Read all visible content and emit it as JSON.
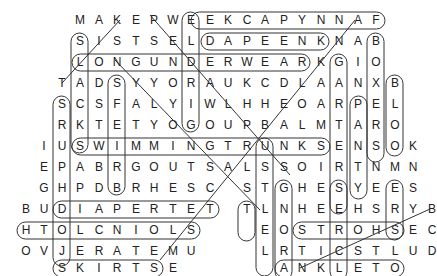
{
  "puzzle": {
    "type": "word-search",
    "rows": [
      {
        "y": 20,
        "cells": [
          [
            80,
            "M"
          ],
          [
            99,
            "A"
          ],
          [
            117,
            "K"
          ],
          [
            136,
            "E"
          ],
          [
            154,
            "P"
          ],
          [
            173,
            "W"
          ],
          [
            191,
            "E"
          ],
          [
            210,
            "E"
          ],
          [
            228,
            "K"
          ],
          [
            247,
            "C"
          ],
          [
            265,
            "A"
          ],
          [
            284,
            "P"
          ],
          [
            302,
            "Y"
          ],
          [
            321,
            "N"
          ],
          [
            339,
            "N"
          ],
          [
            358,
            "A"
          ],
          [
            376,
            "F"
          ]
        ]
      },
      {
        "y": 41,
        "cells": [
          [
            80,
            "S"
          ],
          [
            99,
            "I"
          ],
          [
            117,
            "S"
          ],
          [
            136,
            "T"
          ],
          [
            154,
            "S"
          ],
          [
            173,
            "E"
          ],
          [
            191,
            "L"
          ],
          [
            210,
            "D"
          ],
          [
            228,
            "A"
          ],
          [
            247,
            "P"
          ],
          [
            265,
            "E"
          ],
          [
            284,
            "E"
          ],
          [
            302,
            "N"
          ],
          [
            321,
            "K"
          ],
          [
            339,
            "N"
          ],
          [
            358,
            "A"
          ],
          [
            376,
            "B"
          ]
        ]
      },
      {
        "y": 62,
        "cells": [
          [
            80,
            "L"
          ],
          [
            99,
            "O"
          ],
          [
            117,
            "N"
          ],
          [
            136,
            "G"
          ],
          [
            154,
            "U"
          ],
          [
            173,
            "N"
          ],
          [
            191,
            "D"
          ],
          [
            210,
            "E"
          ],
          [
            228,
            "R"
          ],
          [
            247,
            "W"
          ],
          [
            265,
            "E"
          ],
          [
            284,
            "A"
          ],
          [
            302,
            "R"
          ],
          [
            321,
            "K"
          ],
          [
            339,
            "G"
          ],
          [
            358,
            "I"
          ],
          [
            376,
            "O"
          ]
        ]
      },
      {
        "y": 83,
        "cells": [
          [
            62,
            "T"
          ],
          [
            80,
            "A"
          ],
          [
            99,
            "D"
          ],
          [
            117,
            "S"
          ],
          [
            136,
            "Y"
          ],
          [
            154,
            "Y"
          ],
          [
            173,
            "O"
          ],
          [
            191,
            "R"
          ],
          [
            210,
            "A"
          ],
          [
            228,
            "U"
          ],
          [
            247,
            "K"
          ],
          [
            265,
            "C"
          ],
          [
            284,
            "D"
          ],
          [
            302,
            "L"
          ],
          [
            321,
            "A"
          ],
          [
            339,
            "A"
          ],
          [
            358,
            "N"
          ],
          [
            376,
            "X"
          ],
          [
            395,
            "B"
          ]
        ]
      },
      {
        "y": 104,
        "cells": [
          [
            62,
            "S"
          ],
          [
            80,
            "C"
          ],
          [
            99,
            "S"
          ],
          [
            117,
            "F"
          ],
          [
            136,
            "A"
          ],
          [
            154,
            "L"
          ],
          [
            173,
            "Y"
          ],
          [
            191,
            "I"
          ],
          [
            210,
            "W"
          ],
          [
            228,
            "L"
          ],
          [
            247,
            "H"
          ],
          [
            265,
            "H"
          ],
          [
            284,
            "E"
          ],
          [
            302,
            "O"
          ],
          [
            321,
            "A"
          ],
          [
            339,
            "R"
          ],
          [
            358,
            "P"
          ],
          [
            376,
            "E"
          ],
          [
            395,
            "L"
          ]
        ]
      },
      {
        "y": 125,
        "cells": [
          [
            62,
            "R"
          ],
          [
            80,
            "K"
          ],
          [
            99,
            "T"
          ],
          [
            117,
            "E"
          ],
          [
            136,
            "T"
          ],
          [
            154,
            "Y"
          ],
          [
            173,
            "O"
          ],
          [
            191,
            "G"
          ],
          [
            210,
            "O"
          ],
          [
            228,
            "U"
          ],
          [
            247,
            "P"
          ],
          [
            265,
            "B"
          ],
          [
            284,
            "A"
          ],
          [
            302,
            "L"
          ],
          [
            321,
            "M"
          ],
          [
            339,
            "T"
          ],
          [
            358,
            "A"
          ],
          [
            376,
            "R"
          ],
          [
            395,
            "O"
          ]
        ]
      },
      {
        "y": 146,
        "cells": [
          [
            44,
            "I"
          ],
          [
            62,
            "U"
          ],
          [
            80,
            "S"
          ],
          [
            99,
            "W"
          ],
          [
            117,
            "I"
          ],
          [
            136,
            "M"
          ],
          [
            154,
            "M"
          ],
          [
            173,
            "I"
          ],
          [
            191,
            "N"
          ],
          [
            210,
            "G"
          ],
          [
            228,
            "T"
          ],
          [
            247,
            "R"
          ],
          [
            265,
            "U"
          ],
          [
            284,
            "N"
          ],
          [
            302,
            "K"
          ],
          [
            321,
            "S"
          ],
          [
            339,
            "E"
          ],
          [
            358,
            "N"
          ],
          [
            376,
            "S"
          ],
          [
            395,
            "O"
          ],
          [
            413,
            "K"
          ]
        ]
      },
      {
        "y": 167,
        "cells": [
          [
            44,
            "E"
          ],
          [
            62,
            "P"
          ],
          [
            80,
            "A"
          ],
          [
            99,
            "B"
          ],
          [
            117,
            "R"
          ],
          [
            136,
            "G"
          ],
          [
            154,
            "O"
          ],
          [
            173,
            "U"
          ],
          [
            191,
            "T"
          ],
          [
            210,
            "S"
          ],
          [
            228,
            "A"
          ],
          [
            247,
            "L"
          ],
          [
            265,
            "S"
          ],
          [
            284,
            "S"
          ],
          [
            302,
            "O"
          ],
          [
            321,
            "I"
          ],
          [
            339,
            "R"
          ],
          [
            358,
            "T"
          ],
          [
            376,
            "N"
          ],
          [
            395,
            "M"
          ],
          [
            413,
            "N"
          ]
        ]
      },
      {
        "y": 188,
        "cells": [
          [
            44,
            "G"
          ],
          [
            62,
            "H"
          ],
          [
            80,
            "P"
          ],
          [
            99,
            "D"
          ],
          [
            117,
            "B"
          ],
          [
            136,
            "R"
          ],
          [
            154,
            "H"
          ],
          [
            173,
            "E"
          ],
          [
            191,
            "S"
          ],
          [
            210,
            "C"
          ],
          [
            247,
            "S"
          ],
          [
            265,
            "T"
          ],
          [
            284,
            "G"
          ],
          [
            302,
            "H"
          ],
          [
            321,
            "E"
          ],
          [
            339,
            "S"
          ],
          [
            358,
            "Y"
          ],
          [
            376,
            "E"
          ],
          [
            395,
            "E"
          ],
          [
            413,
            "S"
          ]
        ]
      },
      {
        "y": 209,
        "cells": [
          [
            26,
            "B"
          ],
          [
            44,
            "U"
          ],
          [
            62,
            "D"
          ],
          [
            80,
            "I"
          ],
          [
            99,
            "A"
          ],
          [
            117,
            "P"
          ],
          [
            136,
            "E"
          ],
          [
            154,
            "R"
          ],
          [
            173,
            "T"
          ],
          [
            191,
            "E"
          ],
          [
            210,
            "T"
          ],
          [
            247,
            "T"
          ],
          [
            265,
            "L"
          ],
          [
            284,
            "N"
          ],
          [
            302,
            "H"
          ],
          [
            321,
            "E"
          ],
          [
            339,
            "E"
          ],
          [
            358,
            "H"
          ],
          [
            376,
            "S"
          ],
          [
            395,
            "R"
          ],
          [
            413,
            "Y"
          ],
          [
            432,
            "B"
          ]
        ]
      },
      {
        "y": 230,
        "cells": [
          [
            26,
            "H"
          ],
          [
            44,
            "T"
          ],
          [
            62,
            "O"
          ],
          [
            80,
            "L"
          ],
          [
            99,
            "C"
          ],
          [
            117,
            "N"
          ],
          [
            136,
            "I"
          ],
          [
            154,
            "O"
          ],
          [
            173,
            "L"
          ],
          [
            191,
            "S"
          ],
          [
            265,
            "E"
          ],
          [
            284,
            "O"
          ],
          [
            302,
            "S"
          ],
          [
            321,
            "T"
          ],
          [
            339,
            "R"
          ],
          [
            358,
            "O"
          ],
          [
            376,
            "H"
          ],
          [
            395,
            "S"
          ],
          [
            413,
            "E"
          ],
          [
            432,
            "C"
          ]
        ]
      },
      {
        "y": 251,
        "cells": [
          [
            26,
            "O"
          ],
          [
            44,
            "V"
          ],
          [
            62,
            "J"
          ],
          [
            80,
            "E"
          ],
          [
            99,
            "R"
          ],
          [
            117,
            "A"
          ],
          [
            136,
            "T"
          ],
          [
            154,
            "E"
          ],
          [
            173,
            "M"
          ],
          [
            191,
            "U"
          ],
          [
            265,
            "L"
          ],
          [
            284,
            "R"
          ],
          [
            302,
            "T"
          ],
          [
            321,
            "I"
          ],
          [
            339,
            "C"
          ],
          [
            358,
            "S"
          ],
          [
            376,
            "T"
          ],
          [
            395,
            "L"
          ],
          [
            413,
            "U"
          ],
          [
            432,
            "D"
          ]
        ]
      },
      {
        "y": 268,
        "cells": [
          [
            62,
            "S"
          ],
          [
            80,
            "K"
          ],
          [
            99,
            "I"
          ],
          [
            117,
            "R"
          ],
          [
            136,
            "T"
          ],
          [
            154,
            "S"
          ],
          [
            173,
            "E"
          ],
          [
            284,
            "A"
          ],
          [
            302,
            "N"
          ],
          [
            321,
            "K"
          ],
          [
            339,
            "L"
          ],
          [
            358,
            "E"
          ],
          [
            376,
            "T"
          ],
          [
            395,
            "O"
          ]
        ]
      }
    ],
    "found_words": [
      "KEEPSAKE",
      "DAPEENK",
      "LONGUNDERWEAR",
      "SWIMMINGTRUNKS",
      "DIAPER",
      "HTOLCNIOL",
      "SKIRTS",
      "ANKLET",
      "STROHS",
      "BOXERS",
      "BLOOMERS",
      "PANTIES"
    ]
  }
}
